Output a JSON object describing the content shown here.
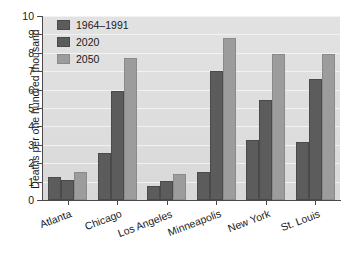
{
  "chart_data": {
    "type": "bar",
    "title": "",
    "subtitle": "",
    "xlabel": "",
    "ylabel": "Deaths per one hundred thousand",
    "ylim": [
      0,
      10
    ],
    "yticks": [
      0,
      1,
      2,
      3,
      4,
      5,
      6,
      7,
      8,
      9,
      10
    ],
    "ytick_labels": [
      "0",
      "1",
      "2",
      "3",
      "4",
      "5",
      "6",
      "7",
      "8",
      "9",
      "10"
    ],
    "grid": true,
    "grid_axis": "y",
    "legend_position": "top-left",
    "categories": [
      "Atlanta",
      "Chicago",
      "Los Angeles",
      "Minneapolis",
      "New York",
      "St. Louis"
    ],
    "series": [
      {
        "name": "1964–1991",
        "color": "#5c5c5c",
        "values": [
          1.25,
          2.55,
          0.75,
          1.5,
          3.25,
          3.15
        ]
      },
      {
        "name": "2020",
        "color": "#5c5c5c",
        "values": [
          1.1,
          5.95,
          1.05,
          7.0,
          5.45,
          6.55
        ]
      },
      {
        "name": "2050",
        "color": "#9c9c9c",
        "values": [
          1.5,
          7.7,
          1.4,
          8.8,
          7.95,
          7.95
        ]
      }
    ]
  },
  "colors": {
    "plot_background": "#dddddd",
    "gridline": "#f2f2f2",
    "axis": "#4a4a4a",
    "text": "#1a1a1a",
    "series_dark": "#5c5c5c",
    "series_light": "#9c9c9c",
    "page_background": "#ffffff"
  }
}
